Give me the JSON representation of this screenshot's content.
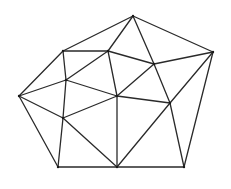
{
  "diagram": {
    "title": "",
    "vertices": {
      "A": [
        133,
        16
      ],
      "B": [
        63,
        51
      ],
      "C": [
        108,
        51
      ],
      "D": [
        213,
        52
      ],
      "E": [
        154,
        64
      ],
      "F": [
        66,
        80
      ],
      "G": [
        19,
        96
      ],
      "H": [
        117,
        96
      ],
      "I": [
        170,
        103
      ],
      "J": [
        63,
        118
      ],
      "K": [
        58,
        167
      ],
      "L": [
        117,
        167
      ],
      "M": [
        184,
        167
      ]
    },
    "edges": [
      [
        "A",
        "B"
      ],
      [
        "A",
        "C"
      ],
      [
        "A",
        "E"
      ],
      [
        "A",
        "D"
      ],
      [
        "B",
        "C"
      ],
      [
        "B",
        "F"
      ],
      [
        "B",
        "G"
      ],
      [
        "C",
        "E"
      ],
      [
        "C",
        "F"
      ],
      [
        "C",
        "H"
      ],
      [
        "D",
        "E"
      ],
      [
        "D",
        "I"
      ],
      [
        "D",
        "M"
      ],
      [
        "E",
        "H"
      ],
      [
        "E",
        "I"
      ],
      [
        "F",
        "G"
      ],
      [
        "F",
        "H"
      ],
      [
        "F",
        "J"
      ],
      [
        "G",
        "J"
      ],
      [
        "G",
        "K"
      ],
      [
        "H",
        "I"
      ],
      [
        "H",
        "J"
      ],
      [
        "H",
        "L"
      ],
      [
        "I",
        "L"
      ],
      [
        "I",
        "M"
      ],
      [
        "J",
        "K"
      ],
      [
        "J",
        "L"
      ],
      [
        "K",
        "L"
      ],
      [
        "L",
        "M"
      ]
    ],
    "stroke_color": "#2a2a2a"
  }
}
